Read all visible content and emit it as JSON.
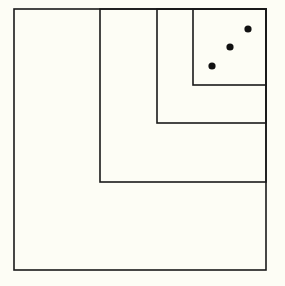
{
  "diagram": {
    "type": "nested-squares",
    "background": "#fdfdf5",
    "stroke": "#1a1a1a",
    "stroke_width": 1.6,
    "squares": [
      {
        "name": "outer",
        "x": 14,
        "y": 9,
        "w": 252,
        "h": 261
      },
      {
        "name": "level-2",
        "x": 100,
        "y": 9,
        "w": 166,
        "h": 173
      },
      {
        "name": "level-3",
        "x": 157,
        "y": 9,
        "w": 109,
        "h": 114
      },
      {
        "name": "level-4",
        "x": 193,
        "y": 9,
        "w": 73,
        "h": 76
      }
    ],
    "dots": [
      {
        "cx": 212,
        "cy": 66,
        "r": 3.6
      },
      {
        "cx": 230,
        "cy": 47,
        "r": 3.6
      },
      {
        "cx": 248,
        "cy": 29,
        "r": 3.6
      }
    ],
    "dot_color": "#111111"
  }
}
